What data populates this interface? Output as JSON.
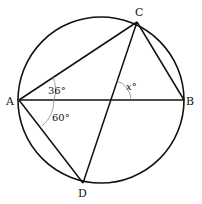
{
  "diagram": {
    "type": "circle-geometry",
    "points": {
      "A": {
        "label": "A",
        "x": 19,
        "y": 100
      },
      "B": {
        "label": "B",
        "x": 184,
        "y": 100
      },
      "C": {
        "label": "C",
        "x": 137,
        "y": 22
      },
      "D": {
        "label": "D",
        "x": 83,
        "y": 183
      }
    },
    "circle": {
      "cx": 101,
      "cy": 100,
      "r": 83
    },
    "segments": [
      "AB",
      "AC",
      "AD",
      "BC",
      "CD"
    ],
    "angles": {
      "CAB": {
        "label": "36°"
      },
      "BAD": {
        "label": "60°"
      },
      "x": {
        "label": "x°"
      }
    }
  }
}
